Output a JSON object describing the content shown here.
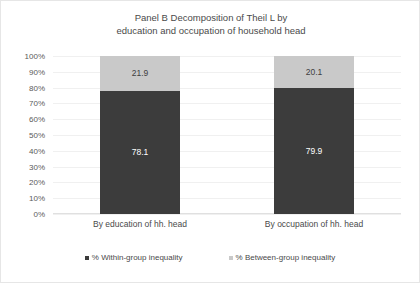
{
  "chart_data": {
    "type": "bar",
    "subtype": "stacked-column-100",
    "title": "Panel B Decomposition of Theil L by\neducation and occupation of household head",
    "xlabel": "",
    "ylabel": "",
    "ylim": [
      0,
      100
    ],
    "ytick_labels": [
      "100%",
      "90%",
      "80%",
      "70%",
      "60%",
      "50%",
      "40%",
      "30%",
      "20%",
      "10%",
      "0%"
    ],
    "ytick_values": [
      100,
      90,
      80,
      70,
      60,
      50,
      40,
      30,
      20,
      10,
      0
    ],
    "grid": true,
    "legend_position": "bottom",
    "categories": [
      "By education of hh. head",
      "By occupation of hh. head"
    ],
    "series": [
      {
        "name": "% Within-group inequality",
        "color": "#3c3c3c",
        "values": [
          78.1,
          79.9
        ],
        "labels": [
          "78.1",
          "79.9"
        ]
      },
      {
        "name": "% Between-group inequality",
        "color": "#c9c9c9",
        "values": [
          21.9,
          20.1
        ],
        "labels": [
          "21.9",
          "20.1"
        ]
      }
    ]
  },
  "legend": {
    "items": [
      {
        "label": "% Within-group inequality",
        "swatch": "dark"
      },
      {
        "label": "% Between-group inequality",
        "swatch": "light"
      }
    ]
  },
  "colors": {
    "within_group": "#3c3c3c",
    "between_group": "#c9c9c9",
    "gridline": "#f0f0f0",
    "text": "#4a4a4a",
    "frame": "#e6e6e6"
  }
}
